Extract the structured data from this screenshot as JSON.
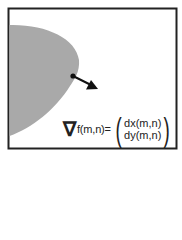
{
  "figure": {
    "frame_color": "#222222",
    "region_color": "#a9a9a9",
    "arrow_color": "#111111",
    "formula": {
      "nabla": "∇",
      "lhs": "f(m,n)=",
      "components": [
        "dx(m,n)",
        "dy(m,n)"
      ]
    }
  }
}
